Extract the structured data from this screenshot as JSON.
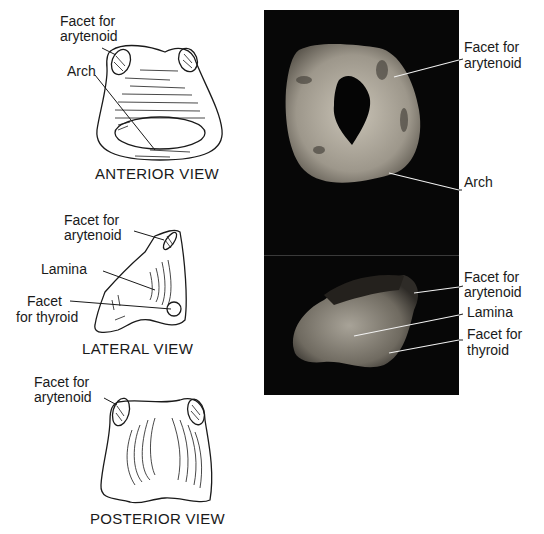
{
  "figure": {
    "drawings": {
      "anterior": {
        "caption": "ANTERIOR VIEW",
        "labels": {
          "facet_line1": "Facet for",
          "facet_line2": "arytenoid",
          "arch": "Arch"
        }
      },
      "lateral": {
        "caption": "LATERAL VIEW",
        "labels": {
          "facet_line1": "Facet for",
          "facet_line2": "arytenoid",
          "lamina": "Lamina",
          "thyroid_line1": "Facet",
          "thyroid_line2": "for thyroid"
        }
      },
      "posterior": {
        "caption": "POSTERIOR VIEW",
        "labels": {
          "facet_line1": "Facet for",
          "facet_line2": "arytenoid"
        }
      }
    },
    "photos": {
      "top": {
        "labels": {
          "facet_line1": "Facet for",
          "facet_line2": "arytenoid",
          "arch": "Arch"
        }
      },
      "bottom": {
        "labels": {
          "facet_line1": "Facet for",
          "facet_line2": "arytenoid",
          "lamina": "Lamina",
          "thyroid_line1": "Facet for",
          "thyroid_line2": "thyroid"
        }
      }
    },
    "colors": {
      "background": "#ffffff",
      "ink": "#1a1a1a",
      "photo_background": "#070707",
      "cartilage": "#b8b2a6"
    }
  }
}
